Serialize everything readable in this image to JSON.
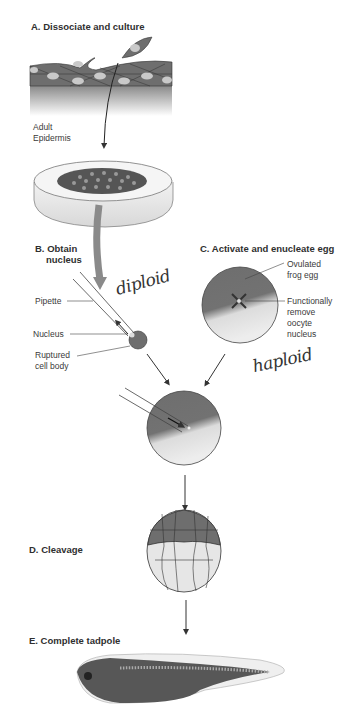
{
  "figure": {
    "sections": {
      "a": {
        "title": "A. Dissociate and culture",
        "label_line1": "Adult",
        "label_line2": "Epidermis"
      },
      "b": {
        "title_line1": "B. Obtain",
        "title_line2": "nucleus",
        "labels": {
          "pipette": "Pipette",
          "nucleus": "Nucleus",
          "ruptured_line1": "Ruptured",
          "ruptured_line2": "cell body"
        }
      },
      "c": {
        "title": "C. Activate and enucleate egg",
        "labels": {
          "egg_line1": "Ovulated",
          "egg_line2": "frog egg",
          "remove_line1": "Functionally",
          "remove_line2": "remove",
          "remove_line3": "oocyte",
          "remove_line4": "nucleus"
        }
      },
      "d": {
        "title": "D. Cleavage"
      },
      "e": {
        "title": "E. Complete tadpole"
      }
    },
    "annotations": {
      "diploid": "diploid",
      "haploid": "haploid"
    },
    "colors": {
      "cell_dark": "#6e6e6e",
      "cell_nucleus": "#c9c9c9",
      "yolk": "#e6e6e6",
      "line": "#333333"
    }
  }
}
